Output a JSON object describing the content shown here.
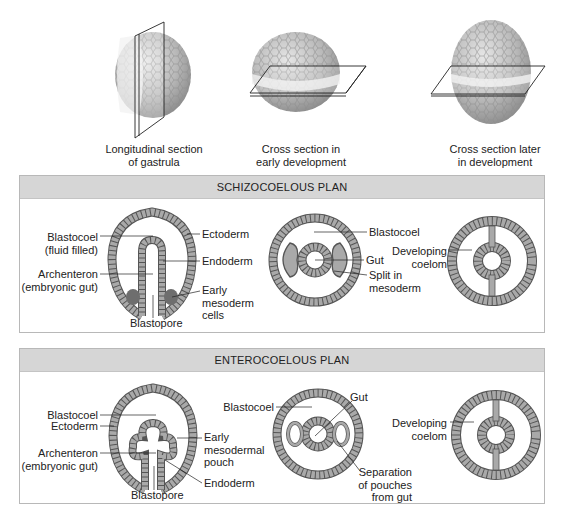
{
  "top_row": {
    "figures": [
      {
        "id": "longitudinal",
        "caption_line1": "Longitudinal section",
        "caption_line2": "of gastrula"
      },
      {
        "id": "cross-early",
        "caption_line1": "Cross section in",
        "caption_line2": "early development"
      },
      {
        "id": "cross-later",
        "caption_line1": "Cross section later",
        "caption_line2": "in development"
      }
    ]
  },
  "schizocoelous": {
    "title": "SCHIZOCOELOUS PLAN",
    "left": {
      "blastocoel_1": "Blastocoel",
      "blastocoel_2": "(fluid filled)",
      "archenteron_1": "Archenteron",
      "archenteron_2": "(embryonic gut)",
      "blastopore": "Blastopore",
      "ectoderm": "Ectoderm",
      "endoderm": "Endoderm",
      "mesoderm_1": "Early",
      "mesoderm_2": "mesoderm",
      "mesoderm_3": "cells"
    },
    "middle": {
      "blastocoel": "Blastocoel",
      "gut": "Gut",
      "split_1": "Split in",
      "split_2": "mesoderm"
    },
    "right": {
      "coelom_1": "Developing",
      "coelom_2": "coelom"
    }
  },
  "enterocoelous": {
    "title": "ENTEROCOELOUS PLAN",
    "left": {
      "blastocoel": "Blastocoel",
      "ectoderm": "Ectoderm",
      "archenteron_1": "Archenteron",
      "archenteron_2": "(embryonic gut)",
      "blastopore": "Blastopore",
      "pouch_1": "Early",
      "pouch_2": "mesodermal",
      "pouch_3": "pouch",
      "endoderm": "Endoderm"
    },
    "middle": {
      "blastocoel": "Blastocoel",
      "gut": "Gut",
      "separation_1": "Separation",
      "separation_2": "of pouches",
      "separation_3": "from gut"
    },
    "right": {
      "coelom_1": "Developing",
      "coelom_2": "coelom"
    }
  },
  "colors": {
    "panel_header": "#d6d6d6",
    "panel_border": "#b8b8b8",
    "cell_layer": "#a9a9a9",
    "cell_outline": "#5a5a5a",
    "mesoderm_dark": "#6e6e6e",
    "sphere_fill": "#bdbdbd"
  }
}
